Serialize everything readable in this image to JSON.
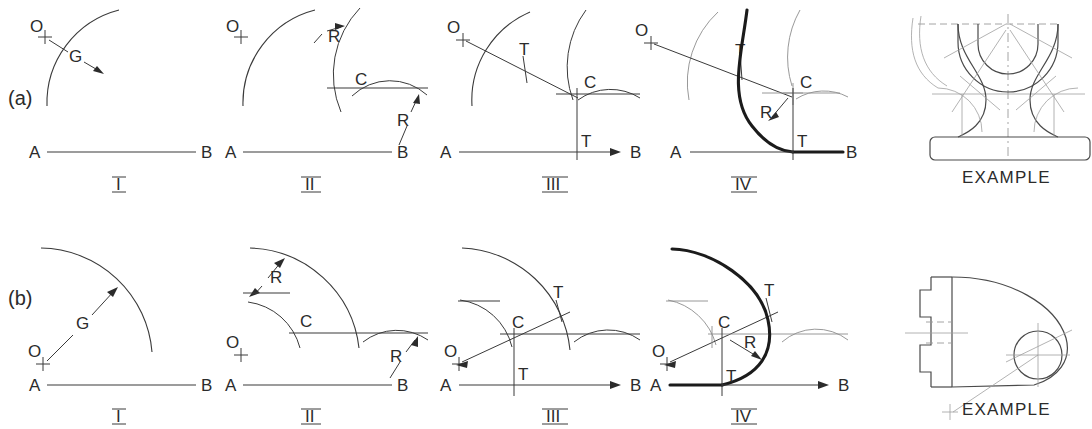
{
  "figure": {
    "background": "#ffffff",
    "ink": "#2b2b2b",
    "heavy_ink": "#1b1b1b",
    "construction_ink": "#8d8d8d",
    "rows": [
      {
        "row_label": "(a)",
        "description": "arc tangent to a line and an arc, concave case",
        "steps": [
          {
            "numeral": "I",
            "labels": {
              "center": "O",
              "given_radius": "G",
              "line_start": "A",
              "line_end": "B"
            }
          },
          {
            "numeral": "II",
            "labels": {
              "center": "O",
              "radius_top": "R",
              "radius_bottom": "R",
              "arc_center": "C",
              "line_start": "A",
              "line_end": "B"
            }
          },
          {
            "numeral": "III",
            "labels": {
              "center": "O",
              "tangent_upper": "T",
              "tangent_lower": "T",
              "arc_center": "C",
              "line_start": "A",
              "line_end": "B"
            }
          },
          {
            "numeral": "IV",
            "labels": {
              "center": "O",
              "tangent_upper": "T",
              "tangent_lower": "T",
              "arc_center": "C",
              "radius": "R",
              "line_start": "A",
              "line_end": "B"
            }
          }
        ],
        "example": {
          "caption": "EXAMPLE",
          "object": "pedestal-with-concave-fillets"
        }
      },
      {
        "row_label": "(b)",
        "description": "arc tangent to a line and an arc, convex case",
        "steps": [
          {
            "numeral": "I",
            "labels": {
              "center": "O",
              "given_radius": "G",
              "line_start": "A",
              "line_end": "B"
            }
          },
          {
            "numeral": "II",
            "labels": {
              "center": "O",
              "radius_top": "R",
              "radius_bottom": "R",
              "arc_center": "C",
              "line_start": "A",
              "line_end": "B"
            }
          },
          {
            "numeral": "III",
            "labels": {
              "center": "O",
              "tangent_upper": "T",
              "tangent_lower": "T",
              "arc_center": "C",
              "line_start": "A",
              "line_end": "B"
            }
          },
          {
            "numeral": "IV",
            "labels": {
              "center": "O",
              "tangent_upper": "T",
              "tangent_lower": "T",
              "arc_center": "C",
              "radius": "R",
              "line_start": "A",
              "line_end": "B"
            }
          }
        ],
        "example": {
          "caption": "EXAMPLE",
          "object": "bracket-with-convex-end-and-hole"
        }
      }
    ]
  }
}
